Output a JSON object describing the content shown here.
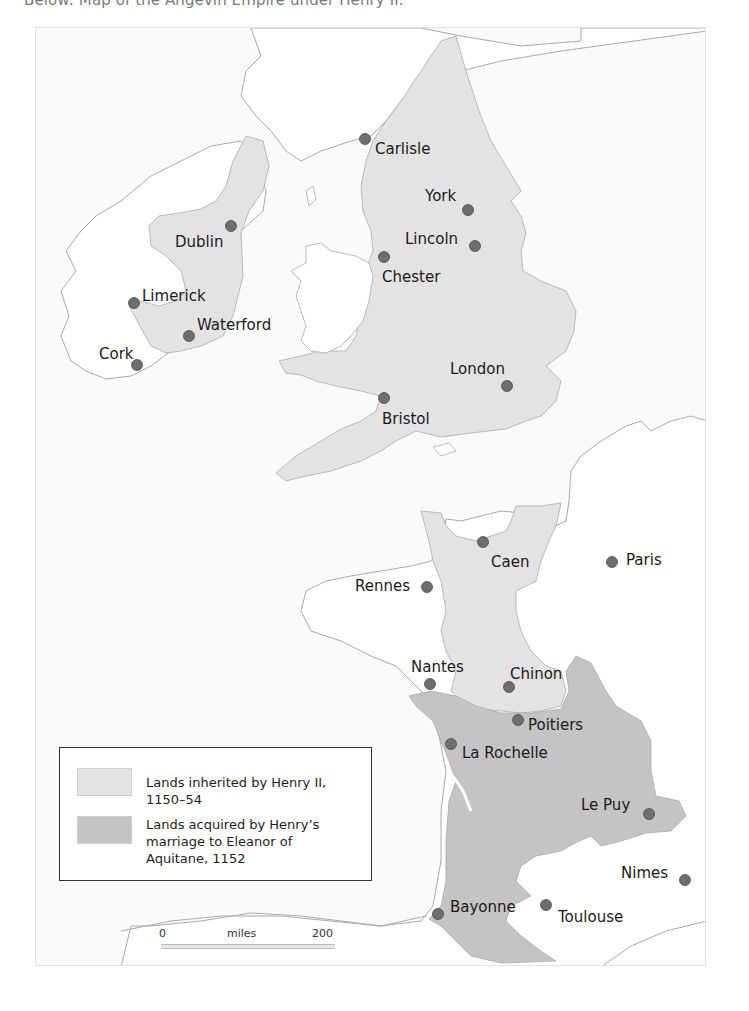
{
  "caption": "Below: Map of the Angevin Empire under Henry II.",
  "colors": {
    "sea": "#fafafa",
    "land_other": "#ffffff",
    "coastline": "#a9a9a9",
    "inherited": "#e3e3e3",
    "marriage": "#c4c4c4",
    "city_dot": "#6e6e6e",
    "city_dot_stroke": "#4a4a4a"
  },
  "legend": {
    "items": [
      {
        "label": "Lands inherited by Henry II, 1150–54",
        "color": "#e3e3e3"
      },
      {
        "label": "Lands acquired by Henry’s marriage to Eleanor of Aquitane, 1152",
        "color": "#c4c4c4"
      }
    ]
  },
  "scale": {
    "start": "0",
    "unit": "miles",
    "end": "200"
  },
  "cities": [
    {
      "name": "Carlisle",
      "x": 364,
      "y": 138,
      "lx": 374,
      "ly": 153
    },
    {
      "name": "York",
      "x": 467,
      "y": 209,
      "lx": 424,
      "ly": 200
    },
    {
      "name": "Lincoln",
      "x": 474,
      "y": 245,
      "lx": 404,
      "ly": 243
    },
    {
      "name": "Chester",
      "x": 383,
      "y": 256,
      "lx": 381,
      "ly": 281
    },
    {
      "name": "Dublin",
      "x": 230,
      "y": 225,
      "lx": 174,
      "ly": 246
    },
    {
      "name": "Limerick",
      "x": 133,
      "y": 302,
      "lx": 141,
      "ly": 300
    },
    {
      "name": "Waterford",
      "x": 188,
      "y": 335,
      "lx": 196,
      "ly": 329
    },
    {
      "name": "Cork",
      "x": 136,
      "y": 364,
      "lx": 98,
      "ly": 358
    },
    {
      "name": "London",
      "x": 506,
      "y": 385,
      "lx": 449,
      "ly": 373
    },
    {
      "name": "Bristol",
      "x": 383,
      "y": 397,
      "lx": 381,
      "ly": 423
    },
    {
      "name": "Caen",
      "x": 482,
      "y": 541,
      "lx": 490,
      "ly": 566
    },
    {
      "name": "Paris",
      "x": 611,
      "y": 561,
      "lx": 625,
      "ly": 564
    },
    {
      "name": "Rennes",
      "x": 426,
      "y": 586,
      "lx": 354,
      "ly": 590
    },
    {
      "name": "Nantes",
      "x": 429,
      "y": 683,
      "lx": 410,
      "ly": 671
    },
    {
      "name": "Chinon",
      "x": 508,
      "y": 686,
      "lx": 509,
      "ly": 678
    },
    {
      "name": "Poitiers",
      "x": 517,
      "y": 719,
      "lx": 527,
      "ly": 729
    },
    {
      "name": "La Rochelle",
      "x": 450,
      "y": 743,
      "lx": 461,
      "ly": 757
    },
    {
      "name": "Le Puy",
      "x": 648,
      "y": 813,
      "lx": 580,
      "ly": 809
    },
    {
      "name": "Nimes",
      "x": 684,
      "y": 879,
      "lx": 620,
      "ly": 877
    },
    {
      "name": "Bayonne",
      "x": 437,
      "y": 913,
      "lx": 449,
      "ly": 911
    },
    {
      "name": "Toulouse",
      "x": 545,
      "y": 904,
      "lx": 557,
      "ly": 921
    }
  ]
}
